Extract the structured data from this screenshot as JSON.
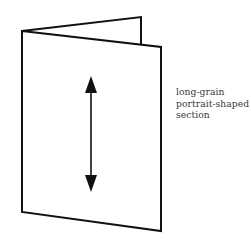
{
  "diagram": {
    "type": "folded-section-illustration",
    "label_lines": [
      "long-grain",
      "portrait-shaped",
      "section"
    ],
    "arrow": {
      "direction": "vertical",
      "meaning": "grain-direction"
    },
    "colors": {
      "stroke": "#111111",
      "text": "#3a3a3a",
      "background": "#ffffff"
    }
  }
}
